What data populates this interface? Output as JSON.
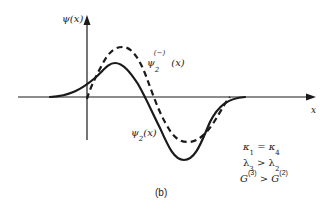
{
  "figure": {
    "y_axis_label": "ψ(x)",
    "x_axis_label": "x",
    "panel_label": "(b)",
    "curves": [
      {
        "id": "solid",
        "label": "ψ₂(x)",
        "style": "solid"
      },
      {
        "id": "dashed",
        "label": "ψ₂⁽⁻⁾(x)",
        "style": "dashed"
      }
    ],
    "conditions": [
      "κ₁ = κ₄",
      "λ₃ > λ₂",
      "G⁽³⁾ > G⁽²⁾"
    ]
  },
  "labels": {
    "psi": "ψ",
    "x_arg": "(x)",
    "x": "x",
    "two": "2",
    "minus": "(−)",
    "panel": "(b)",
    "kappa": "κ",
    "one": "1",
    "four": "4",
    "eq": " = ",
    "lambda": "λ",
    "three": "3",
    "gt": " > ",
    "G": "G",
    "sup3": "(3)",
    "sup2": "(2)"
  },
  "colors": {
    "ink": "#1a1a1a",
    "background": "#ffffff"
  }
}
